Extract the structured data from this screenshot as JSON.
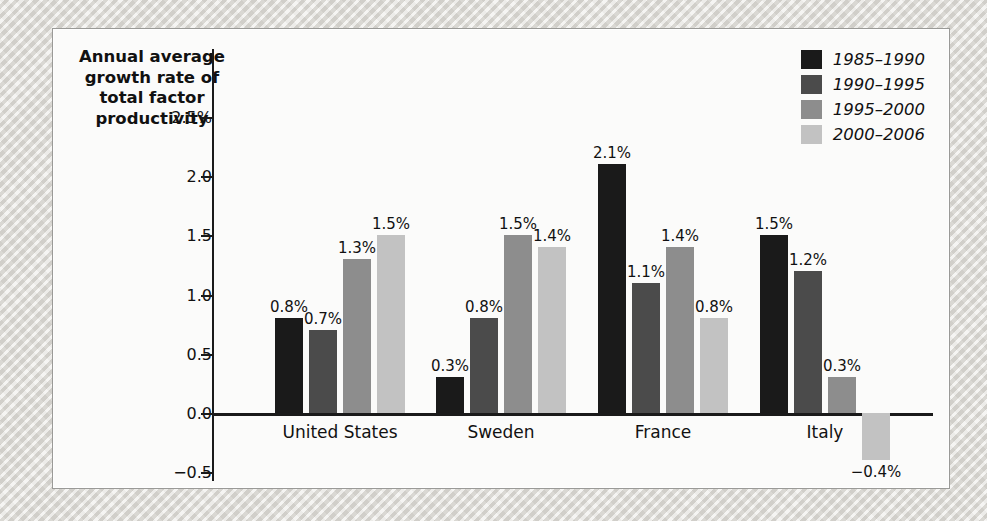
{
  "chart_data": {
    "type": "bar",
    "title": "",
    "ylabel": "Annual average growth rate of total factor productivity",
    "xlabel": "",
    "categories": [
      "United States",
      "Sweden",
      "France",
      "Italy"
    ],
    "series": [
      {
        "name": "1985–1990",
        "color": "#1a1a1a",
        "values": [
          0.8,
          0.3,
          2.1,
          1.5
        ],
        "labels": [
          "0.8%",
          "0.3%",
          "2.1%",
          "1.5%"
        ]
      },
      {
        "name": "1990–1995",
        "color": "#4b4b4b",
        "values": [
          0.7,
          0.8,
          1.1,
          1.2
        ],
        "labels": [
          "0.7%",
          "0.8%",
          "1.1%",
          "1.2%"
        ]
      },
      {
        "name": "1995–2000",
        "color": "#8d8d8d",
        "values": [
          1.3,
          1.5,
          1.4,
          0.3
        ],
        "labels": [
          "1.3%",
          "1.5%",
          "1.4%",
          "0.3%"
        ]
      },
      {
        "name": "2000–2006",
        "color": "#c2c2c2",
        "values": [
          1.5,
          1.4,
          0.8,
          -0.4
        ],
        "labels": [
          "1.5%",
          "1.4%",
          "0.8%",
          "−0.4%"
        ]
      }
    ],
    "yticks": [
      {
        "value": 2.5,
        "label": "2.5%"
      },
      {
        "value": 2.0,
        "label": "2.0"
      },
      {
        "value": 1.5,
        "label": "1.5"
      },
      {
        "value": 1.0,
        "label": "1.0"
      },
      {
        "value": 0.5,
        "label": "0.5"
      },
      {
        "value": 0.0,
        "label": "0.0"
      },
      {
        "value": -0.5,
        "label": "−0.5"
      }
    ],
    "ylim": [
      -0.5,
      2.75
    ],
    "grid": false,
    "legend_position": "top-right"
  },
  "legend": {
    "items": [
      {
        "label": "1985–1990",
        "color": "#1a1a1a"
      },
      {
        "label": "1990–1995",
        "color": "#4b4b4b"
      },
      {
        "label": "1995–2000",
        "color": "#8d8d8d"
      },
      {
        "label": "2000–2006",
        "color": "#c2c2c2"
      }
    ]
  },
  "page": {
    "ghost_text": ""
  }
}
